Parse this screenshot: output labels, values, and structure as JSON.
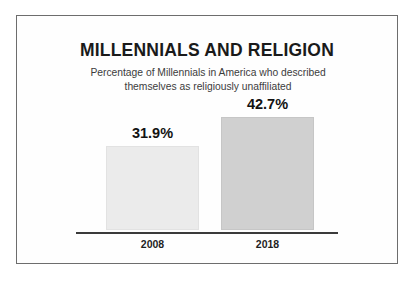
{
  "chart_data": {
    "type": "bar",
    "title": "MILLENNIALS AND RELIGION",
    "subtitle_line1": "Percentage of Millennials in America who described",
    "subtitle_line2": "themselves as religiously unaffiliated",
    "categories": [
      "2008",
      "2018"
    ],
    "values": [
      31.9,
      42.7
    ],
    "value_labels": [
      "31.9%",
      "42.7%"
    ],
    "series": [
      {
        "name": "Percentage religiously unaffiliated",
        "values": [
          31.9,
          42.7
        ]
      }
    ],
    "xlabel": "",
    "ylabel": "",
    "ylim": [
      0,
      48
    ],
    "grid": false,
    "legend": "none",
    "bar_colors": [
      "#ebebeb",
      "#d0d0d0"
    ],
    "bar_border_colors": [
      "#e2e2e2",
      "#c6c6c6"
    ],
    "axis_color": "#3a3a3a",
    "frame_color": "#6d6d6d",
    "title_color": "#1a1a1a",
    "subtitle_color": "#3c3c3c"
  }
}
